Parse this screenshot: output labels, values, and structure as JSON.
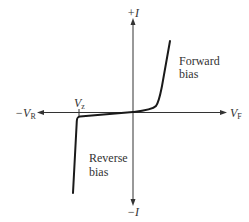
{
  "diagram": {
    "type": "diode-iv-characteristic",
    "axes": {
      "vertical_positive_label": "+I",
      "vertical_negative_label": "−I",
      "horizontal_negative_label": "−V",
      "horizontal_negative_sub": "R",
      "horizontal_positive_label": "V",
      "horizontal_positive_sub": "F"
    },
    "markers": {
      "zener_label": "V",
      "zener_sub": "z"
    },
    "regions": {
      "forward": {
        "line1": "Forward",
        "line2": "bias"
      },
      "reverse": {
        "line1": "Reverse",
        "line2": "bias"
      }
    },
    "colors": {
      "axis": "#333333",
      "curve": "#1a1a1a",
      "text": "#333333",
      "background": "#ffffff"
    }
  }
}
